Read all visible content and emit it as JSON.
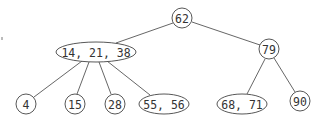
{
  "diagram": {
    "type": "tree",
    "nodes": [
      {
        "id": "n62",
        "label": "62",
        "shape": "circle",
        "cx": 182,
        "cy": 18,
        "rx": 10,
        "ry": 10
      },
      {
        "id": "n14_21_38",
        "label": "14, 21, 38",
        "shape": "ellipse",
        "cx": 96,
        "cy": 52,
        "rx": 40,
        "ry": 10
      },
      {
        "id": "n79",
        "label": "79",
        "shape": "circle",
        "cx": 269,
        "cy": 49,
        "rx": 10,
        "ry": 10
      },
      {
        "id": "n4",
        "label": "4",
        "shape": "circle",
        "cx": 26,
        "cy": 104,
        "rx": 10,
        "ry": 10
      },
      {
        "id": "n15",
        "label": "15",
        "shape": "circle",
        "cx": 75,
        "cy": 104,
        "rx": 10,
        "ry": 10
      },
      {
        "id": "n28",
        "label": "28",
        "shape": "circle",
        "cx": 115,
        "cy": 104,
        "rx": 10,
        "ry": 10
      },
      {
        "id": "n55_56",
        "label": "55, 56",
        "shape": "ellipse",
        "cx": 164,
        "cy": 104,
        "rx": 25,
        "ry": 10
      },
      {
        "id": "n68_71",
        "label": "68, 71",
        "shape": "ellipse",
        "cx": 242,
        "cy": 104,
        "rx": 25,
        "ry": 10
      },
      {
        "id": "n90",
        "label": "90",
        "shape": "circle",
        "cx": 300,
        "cy": 101,
        "rx": 10,
        "ry": 10
      }
    ],
    "edges": [
      {
        "from": "n62",
        "to": "n14_21_38",
        "x1": 173,
        "y1": 23,
        "x2": 116,
        "y2": 43
      },
      {
        "from": "n62",
        "to": "n79",
        "x1": 192,
        "y1": 22,
        "x2": 260,
        "y2": 45
      },
      {
        "from": "n14_21_38",
        "to": "n4",
        "x1": 82,
        "y1": 61,
        "x2": 34,
        "y2": 97
      },
      {
        "from": "n14_21_38",
        "to": "n15",
        "x1": 89,
        "y1": 62,
        "x2": 77,
        "y2": 94
      },
      {
        "from": "n14_21_38",
        "to": "n28",
        "x1": 99,
        "y1": 62,
        "x2": 111,
        "y2": 94
      },
      {
        "from": "n14_21_38",
        "to": "n55_56",
        "x1": 107,
        "y1": 61,
        "x2": 150,
        "y2": 95
      },
      {
        "from": "n79",
        "to": "n68_71",
        "x1": 265,
        "y1": 59,
        "x2": 247,
        "y2": 94
      },
      {
        "from": "n79",
        "to": "n90",
        "x1": 274,
        "y1": 58,
        "x2": 295,
        "y2": 92
      }
    ]
  }
}
